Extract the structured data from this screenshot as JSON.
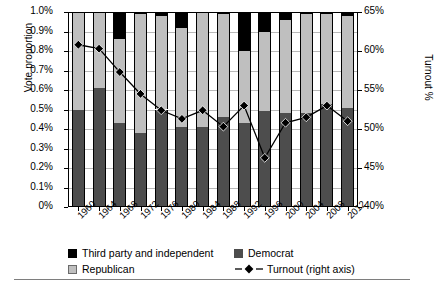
{
  "chart_data": {
    "type": "bar",
    "title": "",
    "xlabel": "",
    "ylabel": "Vote proportion",
    "y2label": "Turnout %",
    "grid": true,
    "legend_position": "bottom",
    "categories": [
      "1960",
      "1964",
      "1968",
      "1972",
      "1976",
      "1980",
      "1984",
      "1988",
      "1992",
      "1996",
      "2000",
      "2004",
      "2008",
      "2012"
    ],
    "ylim": [
      0,
      1.0
    ],
    "yticks": [
      "0%",
      "0.1%",
      "0.2%",
      "0.3%",
      "0.4%",
      "0.5%",
      "0.6%",
      "0.7%",
      "0.8%",
      "0.9%",
      "1.0%"
    ],
    "y2lim": [
      40,
      65
    ],
    "y2ticks": [
      "40%",
      "45%",
      "50%",
      "55%",
      "60%",
      "65%"
    ],
    "series": [
      {
        "name": "Democrat",
        "values": [
          0.5,
          0.61,
          0.43,
          0.38,
          0.5,
          0.41,
          0.41,
          0.46,
          0.43,
          0.49,
          0.48,
          0.48,
          0.53,
          0.51
        ]
      },
      {
        "name": "Republican",
        "values": [
          0.5,
          0.39,
          0.43,
          0.61,
          0.48,
          0.51,
          0.59,
          0.53,
          0.37,
          0.41,
          0.48,
          0.51,
          0.46,
          0.47
        ]
      },
      {
        "name": "Third party and independent",
        "values": [
          0.0,
          0.0,
          0.14,
          0.01,
          0.02,
          0.08,
          0.0,
          0.01,
          0.2,
          0.1,
          0.04,
          0.01,
          0.01,
          0.02
        ]
      }
    ],
    "turnout": {
      "name": "Turnout (right axis)",
      "values": [
        60.8,
        60.3,
        57.3,
        54.5,
        52.4,
        51.3,
        52.4,
        50.3,
        53.0,
        46.3,
        50.8,
        51.5,
        53.0,
        51.0
      ]
    }
  },
  "axes": {
    "left_title": "Vote proportion",
    "right_title": "Turnout %"
  },
  "legend": {
    "items": [
      {
        "label": "Third party and independent",
        "swatch": "third"
      },
      {
        "label": "Democrat",
        "swatch": "dem"
      },
      {
        "label": "Republican",
        "swatch": "rep"
      },
      {
        "label": "Turnout (right axis)",
        "swatch": "line"
      }
    ]
  },
  "colors": {
    "democrat": "#4d4d4d",
    "republican": "#bfbfbf",
    "third_party": "#000000",
    "turnout_line": "#000000",
    "gridline": "#b9b9b9"
  }
}
